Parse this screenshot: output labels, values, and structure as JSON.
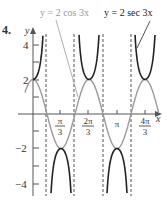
{
  "problem": {
    "number": "4.",
    "top_glyph": "v"
  },
  "chart_data": {
    "type": "line",
    "title": "",
    "xlabel": "x",
    "ylabel": "y",
    "xlim": [
      -0.35,
      1.52
    ],
    "ylim": [
      -4.5,
      5
    ],
    "grid": false,
    "x_ticks": [
      {
        "value": 1.0472,
        "label_num": "π",
        "label_den": "3"
      },
      {
        "value": 2.0944,
        "label_num": "2π",
        "label_den": "3"
      },
      {
        "value": 3.1416,
        "label_num": "π",
        "label_den": ""
      },
      {
        "value": 4.1888,
        "label_num": "4π",
        "label_den": "3"
      }
    ],
    "y_ticks": [
      {
        "value": 4,
        "label": "4"
      },
      {
        "value": 2,
        "label": "2"
      },
      {
        "value": -2,
        "label": "−2"
      },
      {
        "value": -4,
        "label": "−4"
      }
    ],
    "asymptotes": [
      "π/6",
      "π/2",
      "5π/6",
      "7π/6"
    ],
    "series": [
      {
        "name": "y = 2 cos 3x",
        "color": "#999999",
        "function": "2*cos(3x)"
      },
      {
        "name": "y = 2 sec 3x",
        "color": "#222222",
        "function": "2*sec(3x)"
      }
    ],
    "annotations": [
      {
        "text": "y = 2 cos 3x",
        "color": "#999999"
      },
      {
        "text": "y = 2 sec 3x",
        "color": "#222222"
      }
    ]
  }
}
